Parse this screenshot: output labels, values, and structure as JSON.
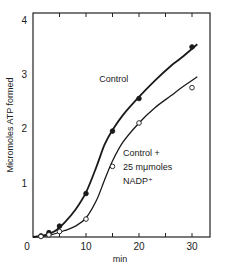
{
  "chart_data": {
    "type": "line",
    "title": "",
    "xlabel": "min",
    "ylabel": "Micromoles ATP formed",
    "xlim": [
      0,
      34
    ],
    "ylim": [
      0,
      4.2
    ],
    "xticks": [
      0,
      10,
      20,
      30
    ],
    "xtick_labels": [
      "0",
      "10",
      "20",
      "30"
    ],
    "xminor_ticks": [
      5,
      15,
      25
    ],
    "yticks": [
      1,
      2,
      3,
      4
    ],
    "ytick_labels": [
      "1",
      "2",
      "3",
      "4"
    ],
    "origin_label": "0",
    "grid": false,
    "legend": null,
    "series": [
      {
        "name": "Control",
        "marker": "filled-circle",
        "x": [
          1.5,
          3,
          5,
          10,
          15,
          20,
          30
        ],
        "values": [
          0.02,
          0.08,
          0.2,
          0.8,
          1.95,
          2.55,
          3.5
        ],
        "curve": [
          [
            0,
            0
          ],
          [
            2,
            0.03
          ],
          [
            4,
            0.1
          ],
          [
            6,
            0.27
          ],
          [
            8,
            0.5
          ],
          [
            10,
            0.82
          ],
          [
            12,
            1.3
          ],
          [
            13.5,
            1.7
          ],
          [
            15,
            1.97
          ],
          [
            17,
            2.25
          ],
          [
            20,
            2.58
          ],
          [
            23,
            2.88
          ],
          [
            26,
            3.15
          ],
          [
            28,
            3.3
          ],
          [
            31,
            3.55
          ]
        ]
      },
      {
        "name": "Control + 25 mμmoles NADP⁺",
        "marker": "open-circle",
        "x": [
          1.5,
          3,
          5,
          10,
          15,
          20,
          30
        ],
        "values": [
          0.01,
          0.04,
          0.1,
          0.33,
          1.3,
          2.1,
          2.75
        ],
        "curve": [
          [
            0,
            0
          ],
          [
            3,
            0.03
          ],
          [
            6,
            0.12
          ],
          [
            8,
            0.2
          ],
          [
            10,
            0.35
          ],
          [
            12,
            0.68
          ],
          [
            13.5,
            1.05
          ],
          [
            15,
            1.4
          ],
          [
            17,
            1.75
          ],
          [
            20,
            2.1
          ],
          [
            23,
            2.38
          ],
          [
            26,
            2.6
          ],
          [
            28,
            2.75
          ],
          [
            31,
            2.95
          ]
        ]
      }
    ],
    "annotations": [
      {
        "text": "Control",
        "x": 12.5,
        "y": 2.85
      },
      {
        "text": "Control +",
        "x": 17,
        "y": 1.5
      },
      {
        "text": "25 mμmoles",
        "x": 17,
        "y": 1.24
      },
      {
        "text": "NADP⁺",
        "x": 17,
        "y": 0.98
      }
    ]
  }
}
